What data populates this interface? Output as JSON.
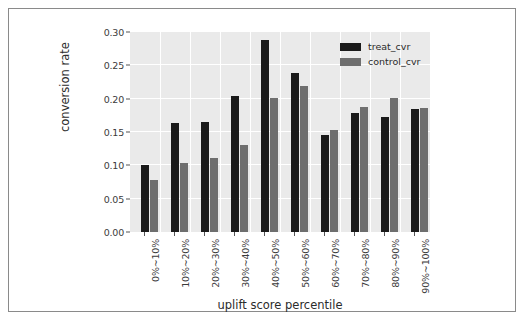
{
  "chart_data": {
    "type": "bar",
    "title": "",
    "xlabel": "uplift score percentile",
    "ylabel": "conversion rate",
    "categories": [
      "0%~10%",
      "10%~20%",
      "20%~30%",
      "30%~40%",
      "40%~50%",
      "50%~60%",
      "60%~70%",
      "70%~80%",
      "80%~90%",
      "90%~100%"
    ],
    "series": [
      {
        "name": "treat_cvr",
        "color": "#1a1a1a",
        "values": [
          0.1,
          0.163,
          0.165,
          0.204,
          0.288,
          0.238,
          0.145,
          0.178,
          0.172,
          0.185
        ]
      },
      {
        "name": "control_cvr",
        "color": "#6e6e6e",
        "values": [
          0.078,
          0.104,
          0.111,
          0.131,
          0.201,
          0.219,
          0.153,
          0.188,
          0.201,
          0.186
        ]
      }
    ],
    "ylim": [
      0.0,
      0.3
    ],
    "yticks": [
      "0.00",
      "0.05",
      "0.10",
      "0.15",
      "0.20",
      "0.25",
      "0.30"
    ],
    "ytick_values": [
      0.0,
      0.05,
      0.1,
      0.15,
      0.2,
      0.25,
      0.3
    ],
    "grid": true,
    "legend_position": "upper right",
    "plot_background": "#eaeaea",
    "grid_color": "#ffffff",
    "figure_background": "#ffffff"
  },
  "legend": {
    "entries": [
      {
        "label": "treat_cvr"
      },
      {
        "label": "control_cvr"
      }
    ]
  }
}
